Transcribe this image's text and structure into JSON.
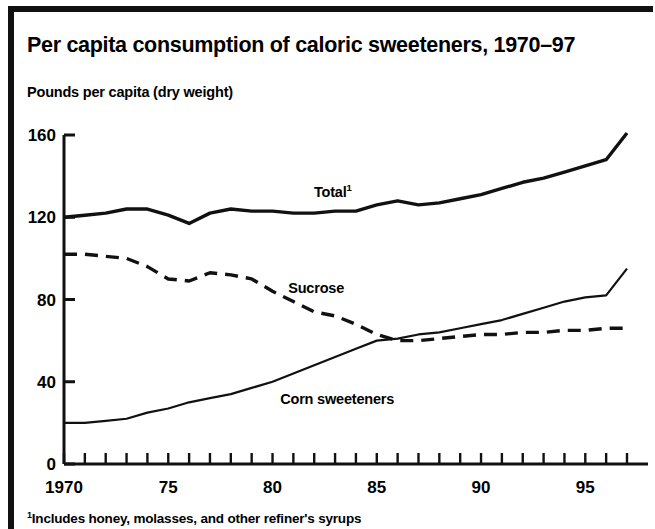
{
  "figure": {
    "title": "Per capita consumption of caloric sweeteners, 1970–97",
    "subtitle": "Pounds per capita (dry weight)",
    "footnote_marker": "1",
    "footnote": "Includes honey, molasses, and other refiner's syrups",
    "frame_color": "#111111",
    "line_color": "#111111",
    "background": "#ffffff"
  },
  "labels": {
    "total": "Total",
    "total_footnote_marker": "1",
    "sucrose": "Sucrose",
    "corn": "Corn sweeteners"
  },
  "chart_data": {
    "type": "line",
    "title": "Per capita consumption of caloric sweeteners, 1970–97",
    "xlabel": "",
    "ylabel": "Pounds per capita (dry weight)",
    "xlim": [
      1970,
      1997
    ],
    "ylim": [
      0,
      160
    ],
    "yticks": [
      0,
      40,
      80,
      120,
      160
    ],
    "ytick_labels": [
      "0",
      "40",
      "80",
      "120",
      "160"
    ],
    "xticks": [
      1970,
      1971,
      1972,
      1973,
      1974,
      1975,
      1976,
      1977,
      1978,
      1979,
      1980,
      1981,
      1982,
      1983,
      1984,
      1985,
      1986,
      1987,
      1988,
      1989,
      1990,
      1991,
      1992,
      1993,
      1994,
      1995,
      1996,
      1997
    ],
    "xtick_labels_shown": [
      "1970",
      "75",
      "80",
      "85",
      "90",
      "95"
    ],
    "xtick_labels_shown_values": [
      1970,
      1975,
      1980,
      1985,
      1990,
      1995
    ],
    "grid": false,
    "legend": "inline annotations",
    "x": [
      1970,
      1971,
      1972,
      1973,
      1974,
      1975,
      1976,
      1977,
      1978,
      1979,
      1980,
      1981,
      1982,
      1983,
      1984,
      1985,
      1986,
      1987,
      1988,
      1989,
      1990,
      1991,
      1992,
      1993,
      1994,
      1995,
      1996,
      1997
    ],
    "series": [
      {
        "name": "Total",
        "style": "solid",
        "width": 3.4,
        "values": [
          120,
          121,
          122,
          124,
          124,
          121,
          117,
          122,
          124,
          123,
          123,
          122,
          122,
          123,
          123,
          126,
          128,
          126,
          127,
          129,
          131,
          134,
          137,
          139,
          142,
          145,
          148,
          161
        ]
      },
      {
        "name": "Sucrose",
        "style": "dashed",
        "width": 3.4,
        "values": [
          102,
          102,
          101,
          100,
          96,
          90,
          89,
          93,
          92,
          90,
          84,
          79,
          74,
          72,
          68,
          63,
          60,
          60,
          61,
          62,
          63,
          63,
          64,
          64,
          65,
          65,
          66,
          66
        ]
      },
      {
        "name": "Corn sweeteners",
        "style": "solid",
        "width": 2.2,
        "values": [
          20,
          20,
          21,
          22,
          25,
          27,
          30,
          32,
          34,
          37,
          40,
          44,
          48,
          52,
          56,
          60,
          61,
          63,
          64,
          66,
          68,
          70,
          73,
          76,
          79,
          81,
          82,
          95
        ]
      }
    ],
    "annotations": [
      {
        "text": "Total",
        "superscript": "1",
        "x": 1984,
        "y": 132
      },
      {
        "text": "Sucrose",
        "x": 1982,
        "y": 85
      },
      {
        "text": "Corn sweeteners",
        "x": 1982,
        "y": 31
      }
    ]
  }
}
